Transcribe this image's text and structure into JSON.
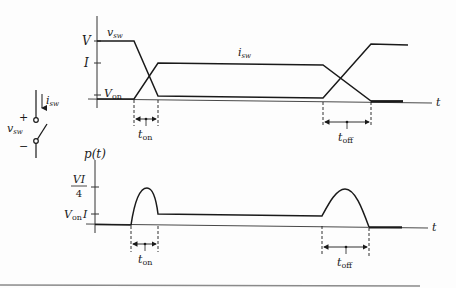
{
  "figure": {
    "switch": {
      "current_label": "i",
      "current_sub": "sw",
      "voltage_label": "v",
      "voltage_sub": "sw",
      "plus": "+",
      "minus": "−"
    },
    "top_plot": {
      "axis_label_t": "t",
      "y_ticks": [
        {
          "label": "V",
          "sub": ""
        },
        {
          "label": "I",
          "sub": ""
        },
        {
          "label": "V",
          "sub": "on"
        }
      ],
      "curve_labels": {
        "vsw": {
          "main": "v",
          "sub": "sw"
        },
        "isw": {
          "main": "i",
          "sub": "sw"
        }
      },
      "intervals": {
        "on": {
          "main": "t",
          "sub": "on"
        },
        "off": {
          "main": "t",
          "sub": "off"
        }
      }
    },
    "bottom_plot": {
      "y_axis_label": "p(t)",
      "axis_label_t": "t",
      "y_ticks": [
        {
          "num": "VI",
          "den": "4"
        },
        {
          "main": "V",
          "sub": "on",
          "suffix": "I"
        }
      ],
      "intervals": {
        "on": {
          "main": "t",
          "sub": "on"
        },
        "off": {
          "main": "t",
          "sub": "off"
        }
      }
    }
  },
  "colors": {
    "ink": "#1a1a1a",
    "axis": "#333333",
    "rule": "#8a8a8a"
  }
}
